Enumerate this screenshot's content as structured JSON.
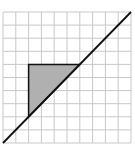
{
  "diagram": {
    "type": "grid-triangle",
    "grid": {
      "columns": 10,
      "rows": 10,
      "line_color": "#c8c8c8",
      "background": "#ffffff"
    },
    "diagonal_line": {
      "from": [
        0,
        0
      ],
      "to": [
        10,
        10
      ],
      "color": "#111111"
    },
    "shaded_triangle": {
      "vertices": [
        [
          2,
          6
        ],
        [
          6,
          6
        ],
        [
          2,
          2
        ]
      ],
      "fill": "#b0b0b0",
      "stroke": "#111111"
    },
    "colors": {
      "grid": "#c8c8c8",
      "line": "#111111",
      "shade": "#b0b0b0"
    }
  }
}
